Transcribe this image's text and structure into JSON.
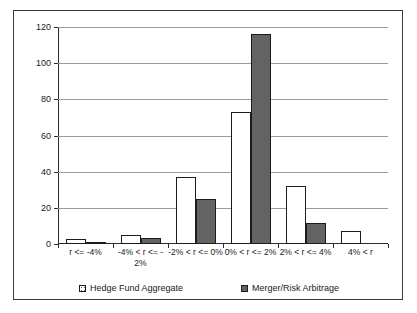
{
  "chart_data": {
    "type": "bar",
    "title": "",
    "xlabel": "",
    "ylabel": "",
    "ylim": [
      0,
      120
    ],
    "yticks": [
      0,
      20,
      40,
      60,
      80,
      100,
      120
    ],
    "grid": true,
    "legend_position": "bottom",
    "categories": [
      "r <= -4%",
      "-4% < r <= -2%",
      "-2% < r <= 0%",
      "0% < r <= 2%",
      "2% < r <= 4%",
      "4% < r"
    ],
    "category_lines": [
      [
        "r <= -4%"
      ],
      [
        "-4% < r <= -",
        "2%"
      ],
      [
        "-2% < r <= 0%"
      ],
      [
        "0% < r <= 2%"
      ],
      [
        "2% < r <= 4%"
      ],
      [
        "4% < r"
      ]
    ],
    "series": [
      {
        "name": "Hedge Fund Aggregate",
        "color": "#ffffff",
        "pattern": "dotted",
        "values": [
          3,
          5,
          37,
          73,
          32,
          7
        ]
      },
      {
        "name": "Merger/Risk Arbitrage",
        "color": "#636363",
        "pattern": "solid",
        "values": [
          1,
          3.5,
          25,
          116,
          11.5,
          0
        ]
      }
    ]
  },
  "axis": {
    "y_tick_labels": [
      "120",
      "100",
      "80",
      "60",
      "40",
      "20",
      "0"
    ]
  },
  "legend": {
    "entries": [
      {
        "label": "Hedge Fund Aggregate"
      },
      {
        "label": "Merger/Risk Arbitrage"
      }
    ]
  }
}
